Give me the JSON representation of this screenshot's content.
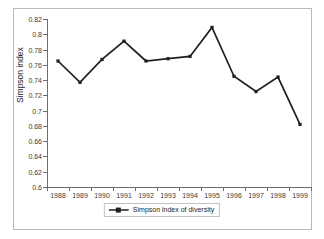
{
  "chart_data": {
    "type": "line",
    "title": "",
    "xlabel": "",
    "ylabel": "Simpson index",
    "categories": [
      "1988",
      "1989",
      "1990",
      "1991",
      "1992",
      "1993",
      "1994",
      "1995",
      "1996",
      "1997",
      "1998",
      "1999"
    ],
    "series": [
      {
        "name": "Simpson index of diversity",
        "values": [
          0.765,
          0.737,
          0.767,
          0.791,
          0.765,
          0.768,
          0.771,
          0.809,
          0.745,
          0.725,
          0.744,
          0.682
        ],
        "color": "#1f1f1f",
        "marker": "square"
      }
    ],
    "ylim": [
      0.6,
      0.82
    ],
    "yticks": [
      0.6,
      0.62,
      0.64,
      0.66,
      0.68,
      0.7,
      0.72,
      0.74,
      0.76,
      0.78,
      0.8,
      0.82
    ],
    "ytick_labels": [
      "0.6",
      "0.62",
      "0.64",
      "0.66",
      "0.68",
      "0.7",
      "0.72",
      "0.74",
      "0.76",
      "0.78",
      "0.8",
      "0.82"
    ],
    "grid": false,
    "legend_position": "bottom-center"
  },
  "legend": {
    "entries": [
      {
        "label": "Simpson index of diversity"
      }
    ]
  },
  "colors": {
    "series_line": "#1f1f1f",
    "axis": "#6e6e6e",
    "frame": "#b9b9b9",
    "background": "#ffffff",
    "tick_text": "#3a3a3a"
  }
}
